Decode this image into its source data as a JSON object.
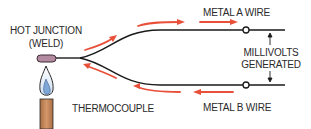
{
  "diagram": {
    "labels": {
      "hot_junction_line1": "HOT JUNCTION",
      "hot_junction_line2": "(WELD)",
      "metal_a": "METAL A WIRE",
      "metal_b": "METAL B WIRE",
      "millivolts_line1": "MILLIVOLTS",
      "millivolts_line2": "GENERATED",
      "thermocouple": "THERMOCOUPLE"
    },
    "colors": {
      "wire": "#1a1a1a",
      "arrow": "#e8503a",
      "weld": "#b38aa0",
      "flame_outer": "#ffffff",
      "flame_inner": "#7fa8d8",
      "tube": "#c88a5a",
      "text": "#2a2a2a"
    },
    "icons": [
      "flame-icon",
      "burner-tube-icon",
      "weld-bead-icon",
      "terminal-icon",
      "current-arrow-icon"
    ]
  }
}
